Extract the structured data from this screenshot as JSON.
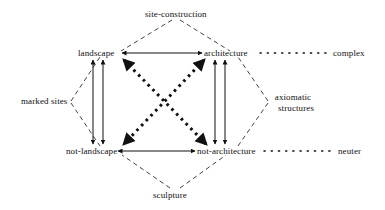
{
  "diagram": {
    "type": "semiotic-square",
    "title": "site-construction",
    "nodes": {
      "top": "site-construction",
      "upper_left": "landscape",
      "upper_right": "architecture",
      "right_outer_top": "complex",
      "left_outer": "marked sites",
      "right_outer_mid_line1": "axiomatic",
      "right_outer_mid_line2": "structures",
      "lower_left": "not-landscape",
      "lower_right": "not-architecture",
      "right_outer_bottom": "neuter",
      "bottom": "sculpture"
    },
    "edges": [
      {
        "name": "top-horizontal",
        "from": "landscape",
        "to": "architecture",
        "style": "solid",
        "arrows": "both"
      },
      {
        "name": "bottom-horizontal",
        "from": "not-landscape",
        "to": "not-architecture",
        "style": "solid",
        "arrows": "both"
      },
      {
        "name": "left-vertical-outer",
        "from": "landscape",
        "to": "not-landscape",
        "style": "solid",
        "arrows": "both"
      },
      {
        "name": "left-vertical-inner",
        "from": "landscape",
        "to": "not-landscape",
        "style": "solid",
        "arrows": "both"
      },
      {
        "name": "right-vertical-outer",
        "from": "architecture",
        "to": "not-architecture",
        "style": "solid",
        "arrows": "both"
      },
      {
        "name": "right-vertical-inner",
        "from": "architecture",
        "to": "not-architecture",
        "style": "solid",
        "arrows": "both"
      },
      {
        "name": "diagonal-nw-se",
        "from": "landscape",
        "to": "not-architecture",
        "style": "thick-dotted",
        "arrows": "both"
      },
      {
        "name": "diagonal-ne-sw",
        "from": "architecture",
        "to": "not-landscape",
        "style": "thick-dotted",
        "arrows": "both"
      },
      {
        "name": "dotted-complex",
        "from": "architecture",
        "to": "complex",
        "style": "dotted",
        "arrows": "none"
      },
      {
        "name": "dotted-neuter",
        "from": "not-architecture",
        "to": "neuter",
        "style": "dotted",
        "arrows": "none"
      },
      {
        "name": "dashed-top-left",
        "from": "site-construction",
        "to": "landscape",
        "style": "dashed",
        "arrows": "none"
      },
      {
        "name": "dashed-top-right",
        "from": "site-construction",
        "to": "architecture",
        "style": "dashed",
        "arrows": "none"
      },
      {
        "name": "dashed-left-upper",
        "from": "marked sites",
        "to": "landscape",
        "style": "dashed",
        "arrows": "none"
      },
      {
        "name": "dashed-left-lower",
        "from": "marked sites",
        "to": "not-landscape",
        "style": "dashed",
        "arrows": "none"
      },
      {
        "name": "dashed-right-upper",
        "from": "axiomatic structures",
        "to": "architecture",
        "style": "dashed",
        "arrows": "none"
      },
      {
        "name": "dashed-right-lower",
        "from": "axiomatic structures",
        "to": "not-architecture",
        "style": "dashed",
        "arrows": "none"
      },
      {
        "name": "dashed-bottom-left",
        "from": "sculpture",
        "to": "not-landscape",
        "style": "dashed",
        "arrows": "none"
      },
      {
        "name": "dashed-bottom-right",
        "from": "sculpture",
        "to": "not-architecture",
        "style": "dashed",
        "arrows": "none"
      }
    ],
    "colors": {
      "line": "#111111",
      "text": "#111111",
      "background": "#ffffff"
    }
  }
}
